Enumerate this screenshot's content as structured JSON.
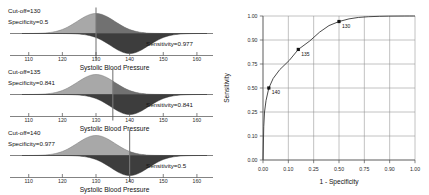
{
  "figure": {
    "kind": "roc-illustration",
    "colors": {
      "healthy_fill": "#a8a8a8",
      "diseased_fill": "#3d3d3d",
      "axis": "#4d4d4d",
      "grid": "#8f8f8f",
      "curve": "#2a2a2a",
      "text": "#111111"
    }
  },
  "panels": [
    {
      "id": "panel-cutoff-130",
      "cutoff_label": "Cut-off=130",
      "specificity_label": "Specificity=0.5",
      "sensitivity_label": "Sensitivity=0.977",
      "cutoff_value": 130,
      "specificity": 0.5,
      "sensitivity": 0.977,
      "xlabel": "Systolic Blood Pressure",
      "xticks": [
        "110",
        "120",
        "130",
        "140",
        "150",
        "160"
      ]
    },
    {
      "id": "panel-cutoff-135",
      "cutoff_label": "Cut-off=135",
      "specificity_label": "Specificity=0.841",
      "sensitivity_label": "Sensitivity=0.841",
      "cutoff_value": 135,
      "specificity": 0.841,
      "sensitivity": 0.841,
      "xlabel": "Systolic Blood Pressure",
      "xticks": [
        "110",
        "120",
        "130",
        "140",
        "150",
        "160"
      ]
    },
    {
      "id": "panel-cutoff-140",
      "cutoff_label": "Cut-off=140",
      "specificity_label": "Specificity=0.977",
      "sensitivity_label": "Sensitivity=0.5",
      "cutoff_value": 140,
      "specificity": 0.977,
      "sensitivity": 0.5,
      "xlabel": "Systolic Blood Pressure",
      "xticks": [
        "110",
        "120",
        "130",
        "140",
        "150",
        "160"
      ]
    }
  ],
  "chart_data": {
    "type": "line",
    "title": "",
    "xlabel": "1 - Specificity",
    "ylabel": "Sensitivity",
    "xlim": [
      0,
      1
    ],
    "ylim": [
      0,
      1
    ],
    "grid": true,
    "legend": "none",
    "xticks": [
      "0.00",
      "0.10",
      "0.25",
      "0.50",
      "0.75",
      "0.90",
      "1.00"
    ],
    "xtick_values": [
      0.0,
      0.1,
      0.25,
      0.5,
      0.75,
      0.9,
      1.0
    ],
    "yticks": [
      "0.00",
      "0.10",
      "0.25",
      "0.50",
      "0.75",
      "0.90",
      "1.00"
    ],
    "ytick_values": [
      0.0,
      0.1,
      0.25,
      0.5,
      0.75,
      0.9,
      1.0
    ],
    "series": [
      {
        "name": "ROC curve",
        "x": [
          0.0,
          0.003,
          0.006,
          0.012,
          0.023,
          0.04,
          0.066,
          0.106,
          0.159,
          0.227,
          0.309,
          0.401,
          0.5,
          0.599,
          0.691,
          0.773,
          0.841,
          0.894,
          0.933,
          0.96,
          0.977,
          0.988,
          0.994,
          0.997,
          1.0
        ],
        "y": [
          0.0,
          0.159,
          0.25,
          0.37,
          0.5,
          0.599,
          0.691,
          0.773,
          0.841,
          0.894,
          0.933,
          0.96,
          0.977,
          0.988,
          0.994,
          0.997,
          0.9987,
          0.9994,
          0.9997,
          0.9999,
          1.0,
          1.0,
          1.0,
          1.0,
          1.0
        ]
      }
    ],
    "points": [
      {
        "label": "140",
        "x": 0.023,
        "y": 0.5
      },
      {
        "label": "135",
        "x": 0.159,
        "y": 0.841
      },
      {
        "label": "130",
        "x": 0.5,
        "y": 0.977
      }
    ]
  }
}
